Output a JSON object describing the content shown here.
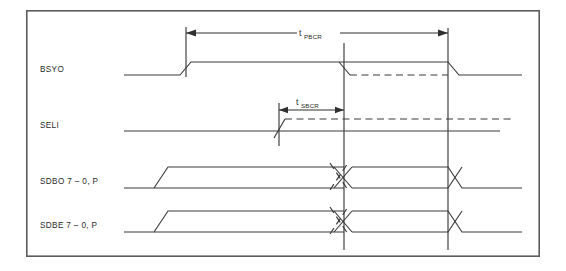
{
  "figure": {
    "kind": "timing-diagram",
    "background_color": "#ffffff",
    "line_color": "#3a3a3a",
    "frame_color": "#5c5c5c",
    "frame": {
      "x": 26,
      "y": 10,
      "width": 514,
      "height": 247
    }
  },
  "signals": [
    {
      "id": "bsyo",
      "label": "BSYO",
      "label_x": 40,
      "label_y": 72,
      "low_y": 75,
      "high_y": 62,
      "type": "level",
      "description": "Goes high at first marker, returns low at right reference line; dashed alternative returns low at first reference line"
    },
    {
      "id": "seli",
      "label": "SELI",
      "label_x": 40,
      "label_y": 128,
      "low_y": 131,
      "high_y": 119,
      "type": "level",
      "description": "Stays low on solid path; dashed alternative rises at SELI marker and remains high"
    },
    {
      "id": "sdbo",
      "label": "SDBO 7 – 0, P",
      "label_x": 40,
      "label_y": 184,
      "low_y": 188,
      "high_y": 167,
      "type": "bus",
      "description": "Data bus valid window; data changes at first reference line and ends at second reference line"
    },
    {
      "id": "sdbe",
      "label": "SDBE 7 – 0, P",
      "label_x": 40,
      "label_y": 228,
      "low_y": 232,
      "high_y": 211,
      "type": "bus",
      "description": "Data bus valid window; data changes at first reference line and ends at second reference line"
    }
  ],
  "timing_markers": [
    {
      "id": "t-pbcr",
      "symbol": "t",
      "subscript": "PBCR",
      "label_x": 315,
      "label_y": 33,
      "dim_y": 33,
      "from_x": 186,
      "to_x": 448,
      "description": "Bus clear delay from BSYO assertion to BSYO release"
    },
    {
      "id": "t-sbcr",
      "symbol": "t",
      "subscript": "SBCR",
      "label_x": 305,
      "label_y": 109,
      "dim_y": 110,
      "from_x": 279,
      "to_x": 344,
      "description": "Select to bus clear delay from SELI assertion to first reference line"
    }
  ],
  "reference_lines": [
    {
      "id": "marker-bsyo-rise",
      "x": 186,
      "y1": 27,
      "y2": 77,
      "kind": "short"
    },
    {
      "id": "marker-seli-rise",
      "x": 279,
      "y1": 103,
      "y2": 146,
      "kind": "short"
    },
    {
      "id": "refline-first",
      "x": 344,
      "y1": 43,
      "y2": 250,
      "kind": "full"
    },
    {
      "id": "refline-second",
      "x": 448,
      "y1": 28,
      "y2": 250,
      "kind": "full"
    }
  ],
  "geometry": {
    "wave_left_x": 124,
    "wave_right_x": 522,
    "edge_slope": 11,
    "bus_skew": 14
  }
}
